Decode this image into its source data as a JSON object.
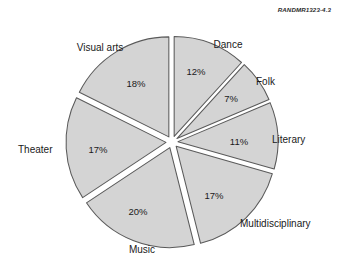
{
  "figure": {
    "source_label": "RANDMR1323-4.3"
  },
  "chart_data": {
    "type": "pie",
    "title": "",
    "xlabel": "",
    "ylabel": "",
    "exploded": true,
    "legend": "none",
    "value_suffix": "%",
    "fill_color": "#d4d4d4",
    "stroke_color": "#5a5a5a",
    "background_color": "#ffffff",
    "categories": [
      "Dance",
      "Folk",
      "Literary",
      "Multidisciplinary",
      "Music",
      "Theater",
      "Visual arts"
    ],
    "values": [
      12,
      7,
      11,
      17,
      20,
      17,
      18
    ],
    "slices": [
      {
        "label": "Dance",
        "value": 12,
        "value_text": "12%",
        "label_x": 228,
        "label_y": 45,
        "label_anchor": "middle",
        "value_x": 196,
        "value_y": 72
      },
      {
        "label": "Folk",
        "value": 7,
        "value_text": "7%",
        "label_x": 256,
        "label_y": 82,
        "label_anchor": "start",
        "value_x": 231,
        "value_y": 99
      },
      {
        "label": "Literary",
        "value": 11,
        "value_text": "11%",
        "label_x": 272,
        "label_y": 140,
        "label_anchor": "start",
        "value_x": 239,
        "value_y": 142
      },
      {
        "label": "Multidisciplinary",
        "value": 17,
        "value_text": "17%",
        "label_x": 240,
        "label_y": 224,
        "label_anchor": "start",
        "value_x": 214,
        "value_y": 196
      },
      {
        "label": "Music",
        "value": 20,
        "value_text": "20%",
        "label_x": 142,
        "label_y": 250,
        "label_anchor": "middle",
        "value_x": 138,
        "value_y": 212
      },
      {
        "label": "Theater",
        "value": 17,
        "value_text": "17%",
        "label_x": 18,
        "label_y": 150,
        "label_anchor": "start",
        "value_x": 98,
        "value_y": 150
      },
      {
        "label": "Visual arts",
        "value": 18,
        "value_text": "18%",
        "label_x": 100,
        "label_y": 48,
        "label_anchor": "middle",
        "value_x": 136,
        "value_y": 84
      }
    ]
  }
}
